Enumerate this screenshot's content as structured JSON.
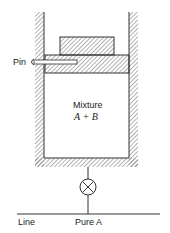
{
  "diagram": {
    "labels": {
      "pin": "Pin",
      "mixture": "Mixture",
      "mixture_formula": "A + B",
      "line": "Line",
      "pure": "Pure A"
    },
    "colors": {
      "stroke": "#333333",
      "hatch": "#555555",
      "background": "#ffffff"
    }
  }
}
